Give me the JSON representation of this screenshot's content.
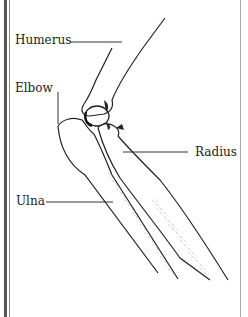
{
  "diagram": {
    "labels": [
      {
        "id": "humerus",
        "text": "Humerus"
      },
      {
        "id": "elbow",
        "text": "Elbow"
      },
      {
        "id": "radius",
        "text": "Radius"
      },
      {
        "id": "ulna",
        "text": "Ulna"
      }
    ],
    "colors": {
      "line": "#222222",
      "shade": "#9a9a9a",
      "border": "#555555",
      "background": "#ffffff"
    }
  }
}
